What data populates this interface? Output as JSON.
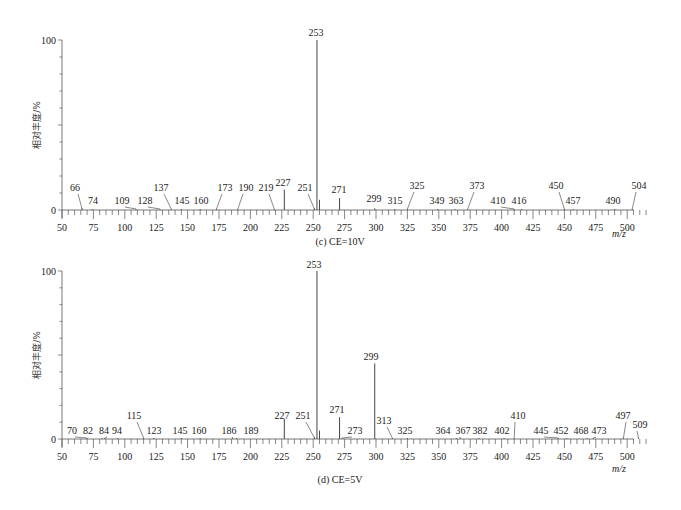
{
  "chart_data": [
    {
      "type": "bar",
      "subtype": "mass-spectrum-stick",
      "caption": "(c) CE=10V",
      "xlabel": "m/z",
      "ylabel": "相对丰度/%",
      "xlim": [
        50,
        515
      ],
      "ylim": [
        0,
        100
      ],
      "xticks": [
        50,
        75,
        100,
        125,
        150,
        175,
        200,
        225,
        250,
        275,
        300,
        325,
        350,
        375,
        400,
        425,
        450,
        475,
        500
      ],
      "yticks": [
        0,
        100
      ],
      "grid": false,
      "peaks": [
        {
          "mz": 66,
          "intensity": 1,
          "label": "66"
        },
        {
          "mz": 74,
          "intensity": 0.5,
          "label": "74"
        },
        {
          "mz": 109,
          "intensity": 0.5,
          "label": "109"
        },
        {
          "mz": 128,
          "intensity": 0.5,
          "label": "128"
        },
        {
          "mz": 137,
          "intensity": 0.5,
          "label": "137"
        },
        {
          "mz": 145,
          "intensity": 0.5,
          "label": "145"
        },
        {
          "mz": 160,
          "intensity": 0.5,
          "label": "160"
        },
        {
          "mz": 173,
          "intensity": 0.5,
          "label": "173"
        },
        {
          "mz": 190,
          "intensity": 0.5,
          "label": "190"
        },
        {
          "mz": 219,
          "intensity": 0.5,
          "label": "219"
        },
        {
          "mz": 227,
          "intensity": 12,
          "label": "227"
        },
        {
          "mz": 251,
          "intensity": 1,
          "label": "251"
        },
        {
          "mz": 253,
          "intensity": 100,
          "label": "253"
        },
        {
          "mz": 255,
          "intensity": 6,
          "label": ""
        },
        {
          "mz": 271,
          "intensity": 7,
          "label": "271"
        },
        {
          "mz": 299,
          "intensity": 1,
          "label": "299"
        },
        {
          "mz": 315,
          "intensity": 0.5,
          "label": "315"
        },
        {
          "mz": 325,
          "intensity": 0.5,
          "label": "325"
        },
        {
          "mz": 349,
          "intensity": 0.5,
          "label": "349"
        },
        {
          "mz": 363,
          "intensity": 0.5,
          "label": "363"
        },
        {
          "mz": 373,
          "intensity": 0.5,
          "label": "373"
        },
        {
          "mz": 410,
          "intensity": 0.5,
          "label": "410"
        },
        {
          "mz": 416,
          "intensity": 0.5,
          "label": "416"
        },
        {
          "mz": 450,
          "intensity": 0.5,
          "label": "450"
        },
        {
          "mz": 457,
          "intensity": 0.5,
          "label": "457"
        },
        {
          "mz": 490,
          "intensity": 0.5,
          "label": "490"
        },
        {
          "mz": 504,
          "intensity": 0.5,
          "label": "504"
        }
      ]
    },
    {
      "type": "bar",
      "subtype": "mass-spectrum-stick",
      "caption": "(d) CE=5V",
      "xlabel": "m/z",
      "ylabel": "相对丰度/%",
      "xlim": [
        50,
        515
      ],
      "ylim": [
        0,
        100
      ],
      "xticks": [
        50,
        75,
        100,
        125,
        150,
        175,
        200,
        225,
        250,
        275,
        300,
        325,
        350,
        375,
        400,
        425,
        450,
        475,
        500
      ],
      "yticks": [
        0,
        100
      ],
      "grid": false,
      "peaks": [
        {
          "mz": 70,
          "intensity": 0.5,
          "label": "70"
        },
        {
          "mz": 82,
          "intensity": 0.5,
          "label": "82"
        },
        {
          "mz": 84,
          "intensity": 0.5,
          "label": "84"
        },
        {
          "mz": 94,
          "intensity": 0.5,
          "label": "94"
        },
        {
          "mz": 115,
          "intensity": 0.5,
          "label": "115"
        },
        {
          "mz": 123,
          "intensity": 0.5,
          "label": "123"
        },
        {
          "mz": 145,
          "intensity": 0.5,
          "label": "145"
        },
        {
          "mz": 160,
          "intensity": 0.5,
          "label": "160"
        },
        {
          "mz": 186,
          "intensity": 0.5,
          "label": "186"
        },
        {
          "mz": 189,
          "intensity": 0.5,
          "label": "189"
        },
        {
          "mz": 227,
          "intensity": 12,
          "label": "227"
        },
        {
          "mz": 251,
          "intensity": 1,
          "label": "251"
        },
        {
          "mz": 253,
          "intensity": 100,
          "label": "253"
        },
        {
          "mz": 255,
          "intensity": 5,
          "label": ""
        },
        {
          "mz": 271,
          "intensity": 13,
          "label": "271"
        },
        {
          "mz": 273,
          "intensity": 0.5,
          "label": "273"
        },
        {
          "mz": 299,
          "intensity": 45,
          "label": "299"
        },
        {
          "mz": 313,
          "intensity": 0.5,
          "label": "313"
        },
        {
          "mz": 325,
          "intensity": 0.5,
          "label": "325"
        },
        {
          "mz": 364,
          "intensity": 0.5,
          "label": "364"
        },
        {
          "mz": 367,
          "intensity": 0.5,
          "label": "367"
        },
        {
          "mz": 382,
          "intensity": 0.5,
          "label": "382"
        },
        {
          "mz": 402,
          "intensity": 0.5,
          "label": "402"
        },
        {
          "mz": 410,
          "intensity": 0.5,
          "label": "410"
        },
        {
          "mz": 445,
          "intensity": 0.5,
          "label": "445"
        },
        {
          "mz": 452,
          "intensity": 0.5,
          "label": "452"
        },
        {
          "mz": 468,
          "intensity": 0.5,
          "label": "468"
        },
        {
          "mz": 473,
          "intensity": 0.5,
          "label": "473"
        },
        {
          "mz": 497,
          "intensity": 0.5,
          "label": "497"
        },
        {
          "mz": 509,
          "intensity": 0.5,
          "label": "509"
        }
      ]
    }
  ],
  "layout": {
    "panels": [
      {
        "x0": 62,
        "xscale": 1.256,
        "y0": 210,
        "y100": 40,
        "xaxis_end": 634,
        "caption_x": 340,
        "caption_y": 245,
        "mz_label_x": 612,
        "mz_label_y": 237,
        "labels": {
          "66": {
            "lx": 75,
            "ly": 191,
            "leader": true
          },
          "74": {
            "lx": 93,
            "ly": 204,
            "leader": false
          },
          "109": {
            "lx": 122,
            "ly": 204,
            "leader": true
          },
          "128": {
            "lx": 145,
            "ly": 204,
            "leader": true
          },
          "137": {
            "lx": 161,
            "ly": 191,
            "leader": true
          },
          "145": {
            "lx": 182,
            "ly": 204,
            "leader": false
          },
          "160": {
            "lx": 201,
            "ly": 204,
            "leader": false
          },
          "173": {
            "lx": 225,
            "ly": 191,
            "leader": true
          },
          "190": {
            "lx": 246,
            "ly": 191,
            "leader": true
          },
          "219": {
            "lx": 266,
            "ly": 191,
            "leader": true
          },
          "227": {
            "lx": 283,
            "ly": 186,
            "leader": false
          },
          "251": {
            "lx": 305,
            "ly": 191,
            "leader": true
          },
          "253": {
            "lx": 316,
            "ly": 36,
            "leader": false
          },
          "271": {
            "lx": 339,
            "ly": 193,
            "leader": false
          },
          "299": {
            "lx": 374,
            "ly": 202,
            "leader": false
          },
          "315": {
            "lx": 395,
            "ly": 204,
            "leader": false
          },
          "325": {
            "lx": 417,
            "ly": 189,
            "leader": true
          },
          "349": {
            "lx": 437,
            "ly": 204,
            "leader": false
          },
          "363": {
            "lx": 456,
            "ly": 204,
            "leader": false
          },
          "373": {
            "lx": 477,
            "ly": 189,
            "leader": true
          },
          "410": {
            "lx": 498,
            "ly": 204,
            "leader": true
          },
          "416": {
            "lx": 519,
            "ly": 204,
            "leader": false
          },
          "450": {
            "lx": 556,
            "ly": 189,
            "leader": true
          },
          "457": {
            "lx": 573,
            "ly": 204,
            "leader": false
          },
          "490": {
            "lx": 613,
            "ly": 204,
            "leader": false
          },
          "504": {
            "lx": 639,
            "ly": 189,
            "leader": true
          }
        }
      },
      {
        "x0": 62,
        "xscale": 1.256,
        "y0": 439,
        "y100": 271,
        "xaxis_end": 634,
        "caption_x": 340,
        "caption_y": 483,
        "mz_label_x": 612,
        "mz_label_y": 472,
        "labels": {
          "70": {
            "lx": 72,
            "ly": 434,
            "leader": true
          },
          "82": {
            "lx": 88,
            "ly": 434,
            "leader": false
          },
          "84": {
            "lx": 104,
            "ly": 434,
            "leader": true
          },
          "94": {
            "lx": 117,
            "ly": 434,
            "leader": false
          },
          "115": {
            "lx": 134,
            "ly": 419,
            "leader": true
          },
          "123": {
            "lx": 154,
            "ly": 434,
            "leader": false
          },
          "145": {
            "lx": 180,
            "ly": 434,
            "leader": false
          },
          "160": {
            "lx": 199,
            "ly": 434,
            "leader": false
          },
          "186": {
            "lx": 229,
            "ly": 434,
            "leader": true
          },
          "189": {
            "lx": 251,
            "ly": 434,
            "leader": false
          },
          "227": {
            "lx": 282,
            "ly": 419,
            "leader": false
          },
          "251": {
            "lx": 303,
            "ly": 419,
            "leader": true
          },
          "253": {
            "lx": 314,
            "ly": 268,
            "leader": false
          },
          "271": {
            "lx": 337,
            "ly": 413,
            "leader": false
          },
          "273": {
            "lx": 355,
            "ly": 434,
            "leader": true
          },
          "299": {
            "lx": 371,
            "ly": 360,
            "leader": false
          },
          "313": {
            "lx": 384,
            "ly": 424,
            "leader": true
          },
          "325": {
            "lx": 405,
            "ly": 434,
            "leader": false
          },
          "364": {
            "lx": 443,
            "ly": 434,
            "leader": false
          },
          "367": {
            "lx": 463,
            "ly": 434,
            "leader": true
          },
          "382": {
            "lx": 480,
            "ly": 434,
            "leader": false
          },
          "402": {
            "lx": 502,
            "ly": 434,
            "leader": false
          },
          "410": {
            "lx": 518,
            "ly": 419,
            "leader": true
          },
          "445": {
            "lx": 541,
            "ly": 434,
            "leader": true
          },
          "452": {
            "lx": 561,
            "ly": 434,
            "leader": false
          },
          "468": {
            "lx": 581,
            "ly": 434,
            "leader": false
          },
          "473": {
            "lx": 599,
            "ly": 434,
            "leader": true
          },
          "497": {
            "lx": 623,
            "ly": 419,
            "leader": true
          },
          "509": {
            "lx": 640,
            "ly": 428,
            "leader": true
          }
        }
      }
    ]
  }
}
